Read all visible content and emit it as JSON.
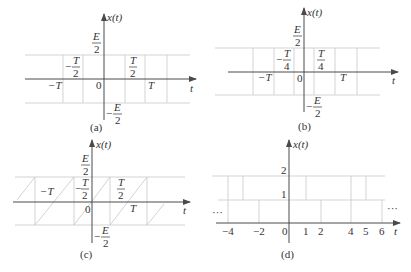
{
  "figure": {
    "panels": [
      {
        "id": "a",
        "caption": "(a)",
        "y_label": "x(t)",
        "x_label": "t",
        "top_label_num": "E",
        "top_label_den": "2",
        "bottom_label_sign": "−",
        "bottom_label_num": "E",
        "bottom_label_den": "2",
        "ticks": {
          "neg_T": "−T",
          "neg_half_sign": "−",
          "neg_half_num": "T",
          "neg_half_den": "2",
          "zero": "0",
          "half_num": "T",
          "half_den": "2",
          "T": "T"
        },
        "waveform": "square wave, amplitude ±E/2, period T, transitions at ±T/2"
      },
      {
        "id": "b",
        "caption": "(b)",
        "y_label": "x(t)",
        "x_label": "t",
        "top_label_num": "E",
        "top_label_den": "2",
        "bottom_label_sign": "−",
        "bottom_label_num": "E",
        "bottom_label_den": "2",
        "ticks": {
          "neg_T": "−T",
          "neg_quarter_sign": "−",
          "neg_quarter_num": "T",
          "neg_quarter_den": "4",
          "zero": "0",
          "quarter_num": "T",
          "quarter_den": "4",
          "T": "T"
        },
        "waveform": "square wave, amplitude ±E/2, period T, transitions at ±T/4"
      },
      {
        "id": "c",
        "caption": "(c)",
        "y_label": "x(t)",
        "x_label": "t",
        "top_label_num": "E",
        "top_label_den": "2",
        "bottom_label_sign": "−",
        "bottom_label_num": "E",
        "bottom_label_den": "2",
        "ticks": {
          "neg_T": "−T",
          "neg_half_sign": "−",
          "neg_half_num": "T",
          "neg_half_den": "2",
          "zero": "0",
          "half_num": "T",
          "half_den": "2",
          "T": "T"
        },
        "waveform": "sawtooth wave, ramps from −E/2 to E/2, period T"
      },
      {
        "id": "d",
        "caption": "(d)",
        "y_label": "x(t)",
        "x_label": "t",
        "y_ticks": [
          "1",
          "2"
        ],
        "x_ticks": [
          "−4",
          "−2",
          "0",
          "1",
          "2",
          "4",
          "5",
          "6"
        ],
        "ellipsis_left": "···",
        "ellipsis_right": "···",
        "waveform": "staircase periodic signal with levels 0, 1, 2"
      }
    ]
  }
}
